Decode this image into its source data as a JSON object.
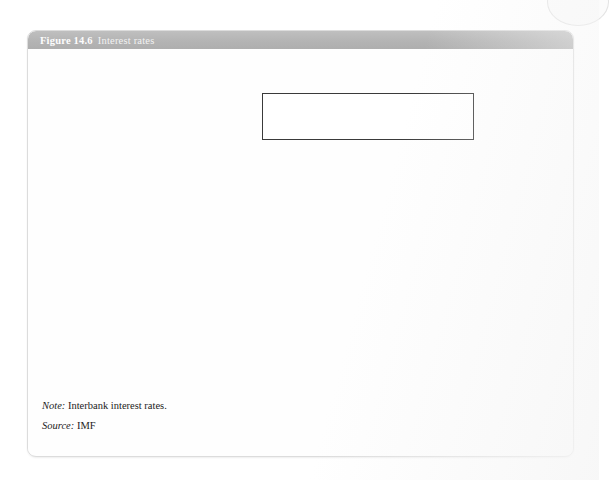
{
  "figure": {
    "number": "Figure 14.6",
    "caption": "Interest rates",
    "note_label": "Note:",
    "note_text": "Interbank interest rates.",
    "source_label": "Source:",
    "source_text": "IMF"
  },
  "colors": {
    "euro_area": "#111111",
    "czech_republic": "#777777",
    "sweden": "#aaaaaa",
    "uk": "#d2d2d2",
    "axis": "#4a4a4a",
    "frame": "#8a8a8a",
    "header_bg": "#b6b6b6",
    "card_bg": "#fefefe"
  },
  "chart_data": {
    "type": "line",
    "title": "Interest rates",
    "xlabel": "",
    "ylabel": "",
    "ylim": [
      0,
      9
    ],
    "yticks": [
      0,
      2,
      4,
      6,
      8
    ],
    "ytick_labels": [
      "0",
      "2",
      "4",
      "6",
      "8"
    ],
    "grid": false,
    "legend_position": "top-right-inside",
    "xlim": [
      1999.0,
      2014.6
    ],
    "xtick_labels": [
      "1999",
      "1999",
      "2000",
      "2001",
      "2002",
      "2002",
      "2003",
      "2004",
      "2005",
      "2005",
      "2006",
      "2006",
      "2007",
      "2008",
      "2008",
      "2009",
      "2010",
      "2011",
      "2011",
      "2012",
      "2013",
      "2014"
    ],
    "xtick_values": [
      1999.0,
      1999.7,
      2000.4,
      2001.1,
      2001.8,
      2002.4,
      2003.0,
      2003.7,
      2004.4,
      2005.0,
      2005.6,
      2006.2,
      2006.9,
      2007.5,
      2008.1,
      2008.8,
      2009.5,
      2010.2,
      2010.9,
      2011.6,
      2012.7,
      2013.8
    ],
    "series": [
      {
        "name": "Euro area",
        "color": "#111111",
        "width": 1.9,
        "x": [
          1999.0,
          1999.2,
          1999.4,
          1999.6,
          1999.8,
          2000.0,
          2000.2,
          2000.4,
          2000.6,
          2000.8,
          2001.0,
          2001.2,
          2001.4,
          2001.6,
          2001.8,
          2002.0,
          2002.3,
          2002.6,
          2003.0,
          2003.3,
          2003.6,
          2004.0,
          2004.4,
          2004.8,
          2005.2,
          2005.6,
          2006.0,
          2006.4,
          2006.8,
          2007.2,
          2007.6,
          2007.9,
          2008.1,
          2008.4,
          2008.7,
          2008.95,
          2009.1,
          2009.3,
          2009.6,
          2010.0,
          2010.4,
          2010.8,
          2011.0,
          2011.2,
          2011.4,
          2011.6,
          2011.8,
          2012.0,
          2012.3,
          2012.7,
          2013.2,
          2013.8,
          2014.2,
          2014.6
        ],
        "y": [
          3.1,
          3.0,
          2.65,
          2.7,
          2.8,
          3.3,
          3.9,
          4.4,
          4.8,
          5.05,
          4.85,
          4.6,
          4.3,
          3.75,
          3.45,
          3.35,
          3.35,
          3.25,
          2.6,
          2.4,
          2.15,
          2.05,
          2.05,
          2.1,
          2.1,
          2.15,
          2.6,
          3.0,
          3.6,
          4.05,
          4.25,
          4.6,
          4.4,
          4.85,
          5.1,
          4.3,
          2.0,
          1.35,
          0.95,
          0.7,
          0.75,
          0.95,
          1.05,
          1.3,
          1.5,
          1.45,
          1.25,
          0.9,
          0.5,
          0.2,
          0.2,
          0.22,
          0.25,
          0.2
        ]
      },
      {
        "name": "Czech Republic",
        "color": "#777777",
        "width": 1.4,
        "x": [
          1999.0,
          1999.15,
          1999.3,
          1999.5,
          1999.7,
          1999.9,
          2000.1,
          2000.4,
          2000.7,
          2001.0,
          2001.3,
          2001.6,
          2001.9,
          2002.2,
          2002.5,
          2002.9,
          2003.3,
          2003.7,
          2004.1,
          2004.5,
          2004.9,
          2005.3,
          2005.7,
          2006.1,
          2006.5,
          2006.9,
          2007.3,
          2007.7,
          2008.0,
          2008.3,
          2008.6,
          2008.9,
          2009.1,
          2009.4,
          2009.8,
          2010.2,
          2010.6,
          2011.0,
          2011.4,
          2011.8,
          2012.2,
          2012.6,
          2013.0,
          2013.5,
          2014.0,
          2014.6
        ],
        "y": [
          8.5,
          8.2,
          7.6,
          6.9,
          6.4,
          6.1,
          5.8,
          5.6,
          5.5,
          5.4,
          5.2,
          5.0,
          4.7,
          4.2,
          3.7,
          3.0,
          2.55,
          2.35,
          2.3,
          2.4,
          2.5,
          2.2,
          1.95,
          2.1,
          2.35,
          2.7,
          3.2,
          3.75,
          4.1,
          4.3,
          4.15,
          4.25,
          3.3,
          2.6,
          2.15,
          1.85,
          1.55,
          1.3,
          1.25,
          1.2,
          1.1,
          0.95,
          0.65,
          0.55,
          0.45,
          0.4
        ]
      },
      {
        "name": "Sweden",
        "color": "#aaaaaa",
        "width": 1.4,
        "x": [
          1999.0,
          1999.3,
          1999.6,
          1999.9,
          2000.2,
          2000.5,
          2000.8,
          2001.1,
          2001.4,
          2001.7,
          2002.0,
          2002.3,
          2002.6,
          2002.9,
          2003.2,
          2003.5,
          2003.8,
          2004.1,
          2004.4,
          2004.7,
          2005.0,
          2005.3,
          2005.6,
          2005.9,
          2006.2,
          2006.6,
          2007.0,
          2007.4,
          2007.8,
          2008.1,
          2008.4,
          2008.7,
          2008.95,
          2009.1,
          2009.3,
          2009.6,
          2010.0,
          2010.4,
          2010.8,
          2011.1,
          2011.4,
          2011.7,
          2012.0,
          2012.3,
          2012.7,
          2013.1,
          2013.6,
          2014.1,
          2014.6
        ],
        "y": [
          3.25,
          3.1,
          3.15,
          3.45,
          3.95,
          4.15,
          4.2,
          4.15,
          4.1,
          4.05,
          4.0,
          4.25,
          4.35,
          4.15,
          3.8,
          3.3,
          2.95,
          2.6,
          2.45,
          2.4,
          2.25,
          1.75,
          1.7,
          1.85,
          2.3,
          2.65,
          3.1,
          3.75,
          4.5,
          4.65,
          4.85,
          5.3,
          5.0,
          2.5,
          1.3,
          0.85,
          0.55,
          0.6,
          1.1,
          1.9,
          2.35,
          2.55,
          2.5,
          2.1,
          1.7,
          1.25,
          1.2,
          1.05,
          0.9
        ]
      },
      {
        "name": "UK",
        "color": "#d2d2d2",
        "width": 1.4,
        "x": [
          1999.0,
          1999.15,
          1999.3,
          1999.45,
          1999.6,
          1999.75,
          1999.9,
          2000.05,
          2000.2,
          2000.35,
          2000.5,
          2000.65,
          2000.8,
          2000.95,
          2001.1,
          2001.3,
          2001.5,
          2001.7,
          2001.9,
          2002.1,
          2002.3,
          2002.5,
          2002.7,
          2002.9,
          2003.1,
          2003.3,
          2003.5,
          2003.7,
          2003.9,
          2004.1,
          2004.3,
          2004.5,
          2004.7,
          2004.9,
          2005.1,
          2005.3,
          2005.5,
          2005.7,
          2005.9,
          2006.1,
          2006.3,
          2006.6,
          2006.9,
          2007.2,
          2007.5,
          2007.8,
          2008.0,
          2008.2,
          2008.4,
          2008.6,
          2008.75,
          2008.85,
          2008.95,
          2009.05,
          2009.2,
          2009.4,
          2009.7,
          2010.0,
          2010.4,
          2010.8,
          2011.2,
          2011.6,
          2012.0,
          2012.4,
          2012.8,
          2013.2,
          2013.7,
          2014.2,
          2014.6
        ],
        "y": [
          5.75,
          5.6,
          5.35,
          5.55,
          5.3,
          5.65,
          5.45,
          5.8,
          5.95,
          5.8,
          6.05,
          5.95,
          6.1,
          5.95,
          5.85,
          5.55,
          5.4,
          5.0,
          4.7,
          4.35,
          4.25,
          4.15,
          4.0,
          3.95,
          3.75,
          3.6,
          3.65,
          3.8,
          4.0,
          4.3,
          4.6,
          4.8,
          4.85,
          4.9,
          4.85,
          4.8,
          4.75,
          4.6,
          4.65,
          4.6,
          4.75,
          5.0,
          5.2,
          5.55,
          5.85,
          6.2,
          6.0,
          5.85,
          5.95,
          6.1,
          6.55,
          5.9,
          4.5,
          3.1,
          2.45,
          1.85,
          1.3,
          1.05,
          0.95,
          0.9,
          0.9,
          0.95,
          1.05,
          1.0,
          0.85,
          0.6,
          0.55,
          0.55,
          0.5
        ]
      }
    ]
  },
  "legend": {
    "items": [
      {
        "label": "Euro area",
        "color": "#111111",
        "width": 2.2
      },
      {
        "label": "Czech Republic",
        "color": "#777777",
        "width": 1.6
      },
      {
        "label": "Sweden",
        "color": "#aaaaaa",
        "width": 1.6
      },
      {
        "label": "UK",
        "color": "#d8d8d8",
        "width": 1.6
      }
    ]
  }
}
